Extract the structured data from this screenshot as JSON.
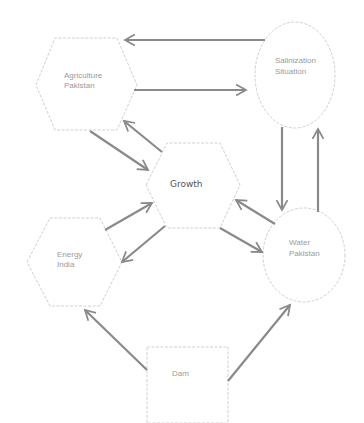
{
  "diagram": {
    "nodes": [
      {
        "id": "agriculture",
        "shape": "hexagon",
        "lines": [
          "Agriculture",
          "Pakistan"
        ]
      },
      {
        "id": "salinization",
        "shape": "ellipse",
        "lines": [
          "Salinization",
          "Situation"
        ]
      },
      {
        "id": "growth",
        "shape": "hexagon",
        "lines": [
          "Growth"
        ]
      },
      {
        "id": "energy",
        "shape": "hexagon",
        "lines": [
          "Energy",
          "India"
        ]
      },
      {
        "id": "water",
        "shape": "ellipse",
        "lines": [
          "Water",
          "Pakistan"
        ]
      },
      {
        "id": "dam",
        "shape": "rectangle",
        "lines": [
          "Dam"
        ]
      }
    ],
    "edges": [
      {
        "from": "salinization",
        "to": "agriculture"
      },
      {
        "from": "agriculture",
        "to": "salinization"
      },
      {
        "from": "agriculture",
        "to": "growth"
      },
      {
        "from": "growth",
        "to": "agriculture"
      },
      {
        "from": "salinization",
        "to": "water"
      },
      {
        "from": "water",
        "to": "salinization"
      },
      {
        "from": "energy",
        "to": "growth"
      },
      {
        "from": "growth",
        "to": "energy"
      },
      {
        "from": "growth",
        "to": "water"
      },
      {
        "from": "water",
        "to": "growth"
      },
      {
        "from": "dam",
        "to": "energy"
      },
      {
        "from": "dam",
        "to": "water"
      }
    ]
  }
}
